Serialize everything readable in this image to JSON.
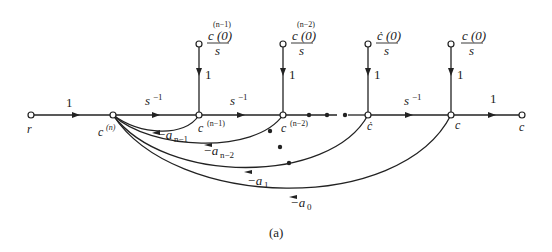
{
  "diagram": {
    "type": "signal-flow-graph",
    "caption": "(a)",
    "nodes": {
      "r": "r",
      "cn": "c",
      "cn_sup": "(n)",
      "cn1": "c",
      "cn1_sup": "(n−1)",
      "cn2": "c",
      "cn2_sup": "(n−2)",
      "cdot": "ċ",
      "c": "c",
      "cout": "c"
    },
    "forward_gains": {
      "r_to_cn": "1",
      "cn_to_cn1": "s",
      "cn_to_cn1_exp": "−1",
      "cn1_to_cn2": "s",
      "cn1_to_cn2_exp": "−1",
      "cdot_to_c": "s",
      "cdot_to_c_exp": "−1",
      "c_to_out": "1"
    },
    "initial_conditions": [
      {
        "num": "c (0)",
        "sup": "(n−1)",
        "den": "s",
        "gain": "1"
      },
      {
        "num": "c (0)",
        "sup": "(n−2)",
        "den": "s",
        "gain": "1"
      },
      {
        "num": "ċ (0)",
        "sup": "",
        "den": "s",
        "gain": "1"
      },
      {
        "num": "c (0)",
        "sup": "",
        "den": "s",
        "gain": "1"
      }
    ],
    "feedback_gains": [
      {
        "sign": "−a",
        "sub": "n−1"
      },
      {
        "sign": "−a",
        "sub": "n−2"
      },
      {
        "sign": "−a",
        "sub": "1"
      },
      {
        "sign": "−a",
        "sub": "0"
      }
    ],
    "ellipsis": "• • •"
  }
}
